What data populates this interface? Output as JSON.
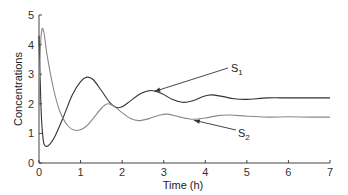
{
  "chart_data": {
    "type": "line",
    "title": "",
    "xlabel": "Time (h)",
    "ylabel": "Concentrations",
    "xlim": [
      0,
      7
    ],
    "ylim": [
      0,
      5
    ],
    "xticks": [
      0,
      1,
      2,
      3,
      4,
      5,
      6,
      7
    ],
    "yticks": [
      0,
      1,
      2,
      3,
      4,
      5
    ],
    "grid": false,
    "legend": "none (inline arrow annotations)",
    "series": [
      {
        "name": "S1",
        "color": "#333333",
        "x": [
          0,
          0.05,
          0.1,
          0.15,
          0.25,
          0.4,
          0.6,
          0.8,
          1.0,
          1.15,
          1.3,
          1.5,
          1.7,
          1.85,
          2.0,
          2.2,
          2.45,
          2.7,
          2.95,
          3.2,
          3.45,
          3.7,
          3.95,
          4.15,
          4.4,
          4.7,
          5.0,
          5.5,
          6.0,
          6.5,
          7.0
        ],
        "y": [
          4.3,
          1.8,
          0.8,
          0.58,
          0.62,
          0.95,
          1.6,
          2.3,
          2.75,
          2.9,
          2.82,
          2.45,
          2.05,
          1.88,
          1.9,
          2.1,
          2.35,
          2.45,
          2.35,
          2.15,
          2.05,
          2.1,
          2.25,
          2.3,
          2.25,
          2.17,
          2.15,
          2.2,
          2.2,
          2.2,
          2.2
        ]
      },
      {
        "name": "S2",
        "color": "#888888",
        "x": [
          0,
          0.03,
          0.07,
          0.12,
          0.2,
          0.35,
          0.5,
          0.7,
          0.9,
          1.1,
          1.3,
          1.5,
          1.65,
          1.8,
          2.0,
          2.2,
          2.4,
          2.65,
          2.9,
          3.1,
          3.4,
          3.7,
          4.0,
          4.3,
          4.6,
          5.0,
          5.5,
          6.0,
          6.5,
          7.0
        ],
        "y": [
          2.0,
          3.8,
          4.5,
          4.4,
          3.6,
          2.5,
          1.75,
          1.25,
          1.1,
          1.2,
          1.5,
          1.85,
          2.0,
          1.92,
          1.7,
          1.5,
          1.43,
          1.5,
          1.62,
          1.65,
          1.55,
          1.48,
          1.52,
          1.6,
          1.62,
          1.58,
          1.55,
          1.56,
          1.55,
          1.55
        ]
      }
    ],
    "annotations": [
      {
        "text": "S1",
        "base": "S",
        "sub": "1",
        "arrow_to": [
          2.75,
          2.45
        ]
      },
      {
        "text": "S2",
        "base": "S",
        "sub": "2",
        "arrow_to": [
          3.7,
          1.48
        ]
      }
    ]
  },
  "labels": {
    "xlabel": "Time (h)",
    "ylabel": "Concentrations",
    "s1_base": "S",
    "s1_sub": "1",
    "s2_base": "S",
    "s2_sub": "2"
  }
}
